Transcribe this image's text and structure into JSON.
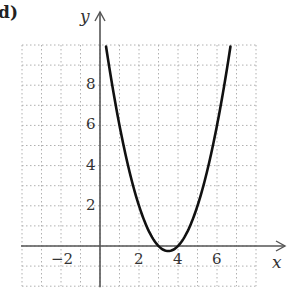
{
  "part_label": "d)",
  "chart_data": {
    "type": "line",
    "title": "",
    "xlabel": "x",
    "ylabel": "y",
    "xlim": [
      -4,
      8
    ],
    "ylim": [
      -2,
      10
    ],
    "grid": true,
    "grid_style": "dotted",
    "x_ticks": [
      -2,
      2,
      4,
      6
    ],
    "y_ticks": [
      2,
      4,
      6,
      8
    ],
    "x_tick_labels": [
      "−2",
      "2",
      "4",
      "6"
    ],
    "y_tick_labels": [
      "2",
      "4",
      "6",
      "8"
    ],
    "series": [
      {
        "name": "y = (x - 3)(x - 4)",
        "equation": "y = x^2 - 7x + 12",
        "vertex": [
          3.5,
          -0.25
        ],
        "roots": [
          3,
          4
        ],
        "x": [
          0.2,
          0.5,
          1,
          1.5,
          2,
          2.5,
          3,
          3.5,
          4,
          4.5,
          5,
          5.5,
          6,
          6.5,
          6.8
        ],
        "y": [
          10.64,
          8.75,
          6,
          3.75,
          2,
          0.75,
          0,
          -0.25,
          0,
          0.75,
          2,
          3.75,
          6,
          8.75,
          10.64
        ],
        "color": "#111111"
      }
    ],
    "axis_color": "#555555",
    "grid_color": "#b0b0b0"
  }
}
